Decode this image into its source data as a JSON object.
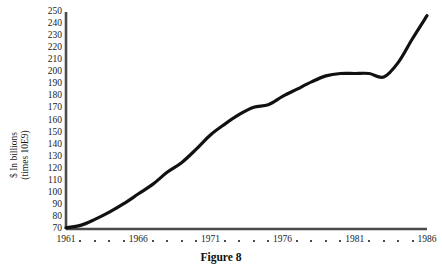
{
  "caption": "Figure 8",
  "chart_data": {
    "type": "line",
    "title": "",
    "subtitle": "",
    "xlabel": "",
    "ylabel": "$ In billions\n(times 10E9)",
    "ylabel_lines": [
      "$ In billions",
      "(times 10E9)"
    ],
    "xlim": [
      1961,
      1986
    ],
    "ylim": [
      70,
      250
    ],
    "grid": false,
    "legend": "none",
    "y_ticks": [
      250,
      240,
      230,
      220,
      210,
      200,
      190,
      180,
      170,
      160,
      150,
      140,
      130,
      120,
      110,
      100,
      90,
      80,
      70
    ],
    "x_ticks_labeled": [
      1961,
      1966,
      1971,
      1976,
      1981,
      1986
    ],
    "x_minor_tick_years": [
      1962,
      1963,
      1964,
      1965,
      1967,
      1968,
      1969,
      1970,
      1972,
      1973,
      1974,
      1975,
      1977,
      1978,
      1979,
      1980,
      1982,
      1983,
      1984,
      1985
    ],
    "x": [
      1961,
      1962,
      1963,
      1964,
      1965,
      1966,
      1967,
      1968,
      1969,
      1970,
      1971,
      1972,
      1973,
      1974,
      1975,
      1976,
      1977,
      1978,
      1979,
      1980,
      1981,
      1982,
      1983,
      1984,
      1985,
      1986
    ],
    "values": [
      71,
      73,
      78,
      84,
      91,
      99,
      107,
      117,
      125,
      136,
      148,
      157,
      165,
      171,
      173,
      180,
      186,
      192,
      197,
      199,
      199,
      199,
      196,
      208,
      228,
      247
    ],
    "series": [
      {
        "name": "$ In billions",
        "values": [
          71,
          73,
          78,
          84,
          91,
          99,
          107,
          117,
          125,
          136,
          148,
          157,
          165,
          171,
          173,
          180,
          186,
          192,
          197,
          199,
          199,
          199,
          196,
          208,
          228,
          247
        ]
      }
    ],
    "line_color": "#111111",
    "axis_color": "#4a4a4a",
    "annotations": []
  }
}
